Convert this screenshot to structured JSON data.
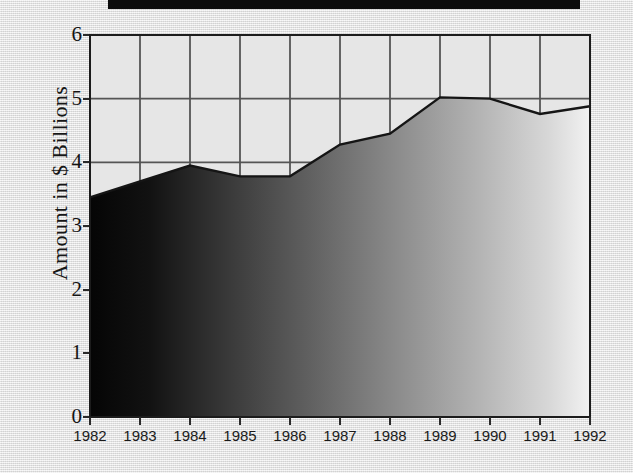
{
  "window": {
    "title_bar_visible": true
  },
  "chart_data": {
    "type": "area",
    "title": "",
    "subtitle": "",
    "xlabel": "",
    "ylabel": "Amount in $ Billions",
    "categories": [
      "1982",
      "1983",
      "1984",
      "1985",
      "1986",
      "1987",
      "1988",
      "1989",
      "1990",
      "1991",
      "1992"
    ],
    "values": [
      3.45,
      3.7,
      3.95,
      3.78,
      3.78,
      4.28,
      4.45,
      5.02,
      5.0,
      4.76,
      4.88
    ],
    "series": [
      {
        "name": "Amount",
        "values": [
          3.45,
          3.7,
          3.95,
          3.78,
          3.78,
          4.28,
          4.45,
          5.02,
          5.0,
          4.76,
          4.88
        ]
      }
    ],
    "ylim": [
      0,
      6
    ],
    "yticks": [
      0,
      1,
      2,
      3,
      4,
      5,
      6
    ],
    "ytick_labels": [
      "0",
      "1",
      "2",
      "3",
      "4",
      "5",
      "6"
    ],
    "grid": true,
    "grid_x": true,
    "grid_y": true,
    "legend": false,
    "legend_position": "none",
    "fill": "horizontal-gradient-dark-to-light",
    "colors": {
      "plot_background": "#e6e6e6",
      "gridline": "#555555",
      "axis": "#1c1c1c",
      "data_line": "#151515",
      "fill_start": "#050505",
      "fill_end": "#f2f2f2",
      "page_background": "#e9e9e9",
      "title_bar": "#0c0c0c",
      "text": "#141414"
    }
  }
}
